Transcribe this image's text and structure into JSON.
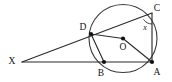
{
  "figure": {
    "background_color": "#ffffff",
    "stroke_color": "#2b2b2b",
    "width": 172,
    "height": 82
  },
  "circle": {
    "center_label": "O",
    "center": {
      "x": 123,
      "y": 38.5
    },
    "radius": 34
  },
  "points": [
    {
      "id": "X",
      "label": "X",
      "x": 22,
      "y": 62,
      "label_x": 12,
      "label_y": 64,
      "on_circle": false,
      "dot": false
    },
    {
      "id": "D",
      "label": "D",
      "x": 91,
      "y": 34,
      "label_x": 83,
      "label_y": 30,
      "on_circle": true,
      "dot": true
    },
    {
      "id": "C",
      "label": "C",
      "x": 152,
      "y": 13,
      "label_x": 155,
      "label_y": 11,
      "on_circle": true,
      "dot": false
    },
    {
      "id": "B",
      "label": "B",
      "x": 104,
      "y": 62,
      "label_x": 100,
      "label_y": 74,
      "on_circle": true,
      "dot": true
    },
    {
      "id": "A",
      "label": "A",
      "x": 152,
      "y": 62,
      "label_x": 156,
      "label_y": 72,
      "on_circle": true,
      "dot": true
    },
    {
      "id": "O",
      "label": "O",
      "x": 123,
      "y": 38.5,
      "label_x": 119,
      "label_y": 49,
      "on_circle": false,
      "dot": true
    }
  ],
  "segments": [
    {
      "id": "XC",
      "from": "X",
      "to": "C",
      "description": "secant through D to C"
    },
    {
      "id": "XA",
      "from": "X",
      "to": "A",
      "description": "secant through B to A"
    },
    {
      "id": "DO",
      "from": "D",
      "to": "O",
      "description": "radius to D"
    },
    {
      "id": "OA",
      "from": "O",
      "to": "A",
      "description": "radius to A"
    },
    {
      "id": "DB",
      "from": "D",
      "to": "B",
      "description": "chord D to B"
    },
    {
      "id": "CA",
      "from": "C",
      "to": "A",
      "description": "chord C to A"
    }
  ],
  "angle_marks": [
    {
      "id": "angle-x",
      "label": "x",
      "at": "C",
      "label_x": 145,
      "label_y": 29,
      "arc_cx": 152,
      "arc_cy": 13,
      "arc_r": 11
    }
  ]
}
